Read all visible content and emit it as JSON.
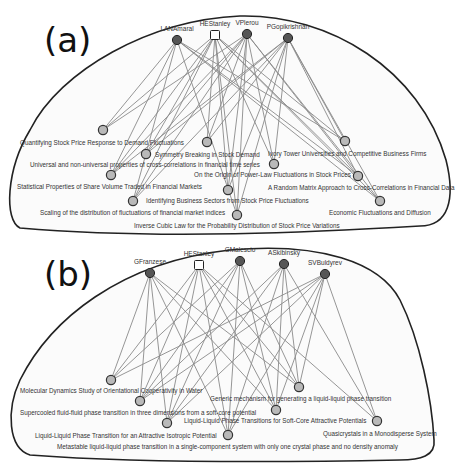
{
  "colors": {
    "author_node": "#555555",
    "hub_node": "#ffffff",
    "paper_node": "#b9b9b9",
    "edge": "#8a8a8a",
    "outline": "#222222"
  },
  "panels": [
    {
      "id": "a",
      "label": "(a)",
      "label_pos": [
        44,
        52
      ],
      "outline": "M 20 228 C 4 220 6 170 30 130 C 60 70 150 20 240 16 C 330 14 420 70 446 160 C 456 200 448 226 420 226 C 320 232 160 240 20 228 Z",
      "authors": [
        {
          "name": "LANAmaral",
          "x": 177,
          "y": 40,
          "shape": "circle"
        },
        {
          "name": "HEStanley",
          "x": 215,
          "y": 35,
          "shape": "square"
        },
        {
          "name": "VPlerou",
          "x": 247,
          "y": 34,
          "shape": "circle"
        },
        {
          "name": "PGopikrishnan",
          "x": 288,
          "y": 38,
          "shape": "circle"
        }
      ],
      "papers": [
        {
          "title": "Quantifying Stock Price Response to Demand Fluctuations",
          "x": 103,
          "y": 130,
          "lx": 20,
          "ly": 145
        },
        {
          "title": "Symmetry Breaking in Stock Demand",
          "x": 146,
          "y": 154,
          "lx": 155,
          "ly": 157
        },
        {
          "title": "Ivory Tower Universities and Competitive Business Firms",
          "x": 345,
          "y": 141,
          "lx": 268,
          "ly": 156
        },
        {
          "title": "Universal and non-universal properties of cross-correlations in  financial time series",
          "x": 207,
          "y": 142,
          "lx": 30,
          "ly": 167
        },
        {
          "title": "On the Origin of Power-Law Fluctuations in Stock Prices",
          "x": 274,
          "y": 164,
          "lx": 194,
          "ly": 177
        },
        {
          "title": "Statistical Properties of Share Volume Traded in Financial Markets",
          "x": 111,
          "y": 175,
          "lx": 17,
          "ly": 189
        },
        {
          "title": "A Random Matrix Approach to Cross-Correlations in Financial Data",
          "x": 358,
          "y": 176,
          "lx": 268,
          "ly": 190
        },
        {
          "title": "Identifying Business Sectors from Stock Price Fluctuations",
          "x": 228,
          "y": 190,
          "lx": 146,
          "ly": 203
        },
        {
          "title": "Scaling of the distribution of fluctuations of financial market indices",
          "x": 133,
          "y": 201,
          "lx": 40,
          "ly": 215
        },
        {
          "title": "Economic Fluctuations and Diffusion",
          "x": 380,
          "y": 201,
          "lx": 329,
          "ly": 215
        },
        {
          "title": "Inverse Cubic Law for the Probability Distribution of Stock Price  Variations",
          "x": 237,
          "y": 215,
          "lx": 134,
          "ly": 228
        }
      ],
      "edges": [
        [
          0,
          0
        ],
        [
          0,
          2
        ],
        [
          0,
          5
        ],
        [
          0,
          8
        ],
        [
          0,
          9
        ],
        [
          0,
          6
        ],
        [
          0,
          10
        ],
        [
          1,
          0
        ],
        [
          1,
          1
        ],
        [
          1,
          3
        ],
        [
          1,
          4
        ],
        [
          1,
          5
        ],
        [
          1,
          6
        ],
        [
          1,
          7
        ],
        [
          1,
          8
        ],
        [
          1,
          9
        ],
        [
          1,
          10
        ],
        [
          1,
          2
        ],
        [
          2,
          0
        ],
        [
          2,
          1
        ],
        [
          2,
          3
        ],
        [
          2,
          4
        ],
        [
          2,
          5
        ],
        [
          2,
          6
        ],
        [
          2,
          7
        ],
        [
          2,
          8
        ],
        [
          2,
          9
        ],
        [
          2,
          10
        ],
        [
          3,
          1
        ],
        [
          3,
          3
        ],
        [
          3,
          4
        ],
        [
          3,
          5
        ],
        [
          3,
          6
        ],
        [
          3,
          7
        ],
        [
          3,
          8
        ],
        [
          3,
          9
        ],
        [
          3,
          10
        ],
        [
          3,
          2
        ]
      ]
    },
    {
      "id": "b",
      "label": "(b)",
      "label_pos": [
        44,
        286
      ],
      "outline": "M 30 455 C 8 448 6 410 20 380 C 50 320 120 262 230 250 C 320 242 380 262 400 300 C 420 340 432 400 434 440 C 436 456 420 460 400 460 C 300 462 150 464 30 455 Z",
      "authors": [
        {
          "name": "GFranzese",
          "x": 150,
          "y": 273,
          "shape": "circle"
        },
        {
          "name": "HEStanley",
          "x": 199,
          "y": 265,
          "shape": "square"
        },
        {
          "name": "GMalescio",
          "x": 240,
          "y": 261,
          "shape": "circle"
        },
        {
          "name": "ASkibinsky",
          "x": 284,
          "y": 264,
          "shape": "circle"
        },
        {
          "name": "SVBuldyrev",
          "x": 325,
          "y": 274,
          "shape": "circle"
        }
      ],
      "papers": [
        {
          "title": "Molecular Dynamics Study of Orientational Cooperativity in Water",
          "x": 111,
          "y": 380,
          "lx": 20,
          "ly": 393
        },
        {
          "title": "Generic mechanism for generating a liquid-liquid phase transition",
          "x": 299,
          "y": 387,
          "lx": 210,
          "ly": 401
        },
        {
          "title": "Supercooled fluid-fluid phase transition in three dimensions from a  soft-core potential",
          "x": 140,
          "y": 401,
          "lx": 20,
          "ly": 415
        },
        {
          "title": "Liquid-Liquid Phase Transitions for Soft-Core Attractive Potentials",
          "x": 276,
          "y": 410,
          "lx": 184,
          "ly": 423
        },
        {
          "title": "Liquid-Liquid Phase Transition for an Attractive Isotropic Potential",
          "x": 167,
          "y": 423,
          "lx": 35,
          "ly": 438
        },
        {
          "title": "Quasicrystals in a Monodisperse System",
          "x": 377,
          "y": 421,
          "lx": 323,
          "ly": 436
        },
        {
          "title": "Metastable liquid-liquid phase transition in a single-component system  with only one crystal phase and no density anomaly",
          "x": 228,
          "y": 435,
          "lx": 57,
          "ly": 449
        }
      ],
      "edges": [
        [
          0,
          0
        ],
        [
          0,
          2
        ],
        [
          0,
          4
        ],
        [
          0,
          6
        ],
        [
          0,
          1
        ],
        [
          0,
          3
        ],
        [
          1,
          0
        ],
        [
          1,
          2
        ],
        [
          1,
          4
        ],
        [
          1,
          6
        ],
        [
          1,
          1
        ],
        [
          1,
          3
        ],
        [
          1,
          5
        ],
        [
          2,
          2
        ],
        [
          2,
          4
        ],
        [
          2,
          6
        ],
        [
          2,
          3
        ],
        [
          2,
          1
        ],
        [
          2,
          0
        ],
        [
          3,
          2
        ],
        [
          3,
          4
        ],
        [
          3,
          6
        ],
        [
          3,
          3
        ],
        [
          3,
          1
        ],
        [
          3,
          5
        ],
        [
          4,
          0
        ],
        [
          4,
          2
        ],
        [
          4,
          4
        ],
        [
          4,
          6
        ],
        [
          4,
          3
        ],
        [
          4,
          1
        ],
        [
          4,
          5
        ]
      ]
    }
  ]
}
